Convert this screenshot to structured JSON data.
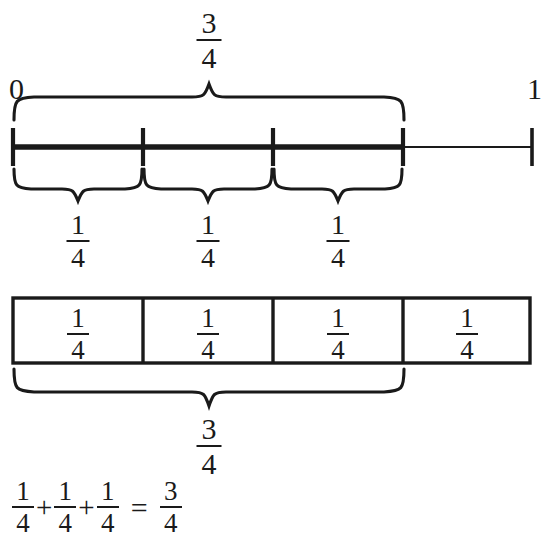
{
  "figure": {
    "colors": {
      "ink": "#1a1a1a",
      "background": "#ffffff"
    }
  },
  "number_line": {
    "start_label": "0",
    "end_label": "1",
    "tick_count": 5,
    "highlighted_fraction": "3/4",
    "top_brace_label": {
      "numerator": "3",
      "denominator": "4"
    },
    "segment_labels": [
      {
        "numerator": "1",
        "denominator": "4"
      },
      {
        "numerator": "1",
        "denominator": "4"
      },
      {
        "numerator": "1",
        "denominator": "4"
      }
    ]
  },
  "bar_model": {
    "cells": [
      {
        "numerator": "1",
        "denominator": "4"
      },
      {
        "numerator": "1",
        "denominator": "4"
      },
      {
        "numerator": "1",
        "denominator": "4"
      },
      {
        "numerator": "1",
        "denominator": "4"
      }
    ],
    "brace_label": {
      "numerator": "3",
      "denominator": "4"
    }
  },
  "equation": {
    "terms": [
      {
        "numerator": "1",
        "denominator": "4"
      },
      {
        "numerator": "1",
        "denominator": "4"
      },
      {
        "numerator": "1",
        "denominator": "4"
      }
    ],
    "plus": "+",
    "equals": "=",
    "result": {
      "numerator": "3",
      "denominator": "4"
    }
  }
}
